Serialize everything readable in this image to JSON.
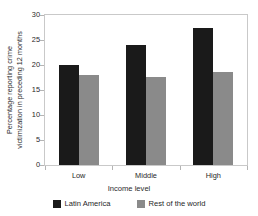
{
  "chart_data": {
    "type": "bar",
    "title": "",
    "subtitle": "",
    "xlabel": "Income level",
    "ylabel": "Percentage reporting crime victimization in preceding 12 months",
    "ylabel_line1": "Percentage reporting crime",
    "ylabel_line2": "victimization in preceding 12 months",
    "categories": [
      "Low",
      "Middle",
      "High"
    ],
    "series": [
      {
        "name": "Latin America",
        "color": "#1a1a1a",
        "values": [
          20.0,
          24.0,
          27.5
        ]
      },
      {
        "name": "Rest of the world",
        "color": "#8a8a8a",
        "values": [
          18.0,
          17.6,
          18.7
        ]
      }
    ],
    "ylim": [
      0,
      30
    ],
    "yticks": [
      0,
      5,
      10,
      15,
      20,
      25,
      30
    ],
    "ytick_labels": [
      "0",
      "5",
      "10",
      "15",
      "20",
      "25",
      "30"
    ],
    "grid": false,
    "legend_position": "bottom",
    "frame_color": "#c9c9c9",
    "background": "#ffffff"
  }
}
